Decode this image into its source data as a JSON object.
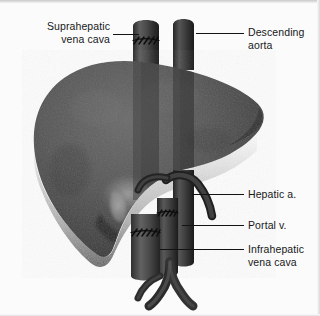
{
  "figure": {
    "type": "anatomical-illustration",
    "palette": {
      "background": "#fbfbfb",
      "liver_light": "#5d5d5d",
      "liver_mid": "#4a4a4a",
      "liver_dark": "#2e2e2e",
      "liver_shadow": "#1b1b1b",
      "vessel_light": "#565656",
      "vessel_mid": "#3c3c3c",
      "vessel_dark": "#242424",
      "suture": "#111111",
      "text": "#17181a",
      "leader": "#121315"
    }
  },
  "labels": [
    {
      "id": "suprahepatic-vena-cava",
      "text": "Suprahepatic\nvena cava",
      "align": "right",
      "x": 14,
      "y": 20,
      "width": 96,
      "leader": {
        "x": 113,
        "y": 34,
        "length": 26
      }
    },
    {
      "id": "descending-aorta",
      "text": "Descending\naorta",
      "align": "left",
      "x": 248,
      "y": 26,
      "width": 70,
      "leader": {
        "x": 196,
        "y": 33,
        "length": 48
      }
    },
    {
      "id": "hepatic-artery",
      "text": "Hepatic a.",
      "align": "left",
      "x": 248,
      "y": 188,
      "width": 70,
      "leader": {
        "x": 192,
        "y": 194,
        "length": 52
      }
    },
    {
      "id": "portal-vein",
      "text": "Portal v.",
      "align": "left",
      "x": 248,
      "y": 219,
      "width": 70,
      "leader": {
        "x": 182,
        "y": 225,
        "length": 62
      }
    },
    {
      "id": "infrahepatic-vena-cava",
      "text": "Infrahepatic\nvena cava",
      "align": "left",
      "x": 248,
      "y": 243,
      "width": 72,
      "leader": {
        "x": 160,
        "y": 249,
        "length": 84
      }
    }
  ],
  "structures": [
    {
      "id": "liver",
      "name": "liver"
    },
    {
      "id": "suprahepatic-cava-cuff",
      "name": "suprahepatic vena cava cuff"
    },
    {
      "id": "aortic-conduit",
      "name": "descending aortic conduit"
    },
    {
      "id": "infrahepatic-cava-cuff",
      "name": "infrahepatic vena cava cuff"
    },
    {
      "id": "portal-vein-trunk",
      "name": "portal vein"
    },
    {
      "id": "hepatic-artery-branch",
      "name": "hepatic artery"
    },
    {
      "id": "iliac-bifurcation",
      "name": "iliac vein bifurcation"
    },
    {
      "id": "suture-line-superior",
      "name": "superior anastomotic suture line"
    },
    {
      "id": "suture-line-inferior",
      "name": "inferior anastomotic suture line"
    },
    {
      "id": "suture-line-portal",
      "name": "portal anastomotic suture line"
    }
  ]
}
